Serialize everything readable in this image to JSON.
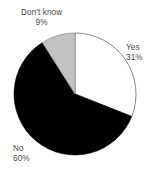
{
  "chart_data": {
    "type": "pie",
    "title": "",
    "subtitle": "",
    "xlabel": "",
    "ylabel": "",
    "legend_position": "none",
    "grid": false,
    "start_angle_deg": 0,
    "direction": "clockwise",
    "categories": [
      "Yes",
      "No",
      "Don't know"
    ],
    "values": [
      31,
      60,
      9
    ],
    "value_unit": "%",
    "colors": [
      "#ffffff",
      "#000000",
      "#c2c2c2"
    ],
    "outline_color": "#8a8a8a",
    "slices": [
      {
        "label": "Yes",
        "value": 31,
        "value_text": "31%",
        "color": "#ffffff",
        "start_deg": 0,
        "end_deg": 111.6
      },
      {
        "label": "No",
        "value": 60,
        "value_text": "60%",
        "color": "#000000",
        "start_deg": 111.6,
        "end_deg": 327.6
      },
      {
        "label": "Don't know",
        "value": 9,
        "value_text": "9%",
        "color": "#c2c2c2",
        "start_deg": 327.6,
        "end_deg": 360
      }
    ]
  },
  "labels": {
    "yes": {
      "name": "Yes",
      "value_text": "31%"
    },
    "no": {
      "name": "No",
      "value_text": "60%"
    },
    "dont_know": {
      "name": "Don't know",
      "value_text": "9%"
    }
  }
}
